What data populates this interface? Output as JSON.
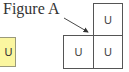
{
  "figure": {
    "label": "Figure A",
    "cells": [
      {
        "id": "top-right",
        "text": "U"
      },
      {
        "id": "bottom-left",
        "text": "U"
      },
      {
        "id": "bottom-right",
        "text": "U"
      }
    ]
  },
  "side_tile": {
    "text": "U",
    "color": "#fbf6a0"
  },
  "arrow": {
    "color": "#333333"
  }
}
